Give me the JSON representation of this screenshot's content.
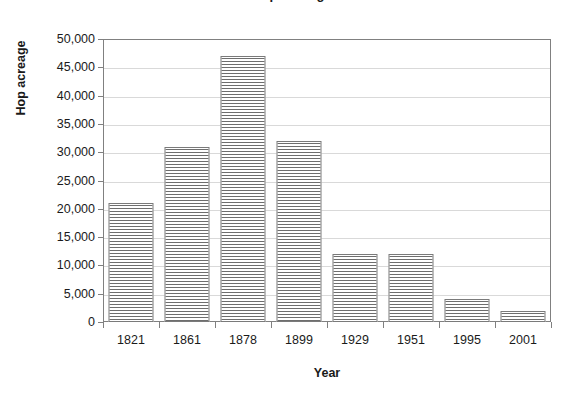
{
  "chart_data": {
    "type": "bar",
    "title": "Hop acreage",
    "title_visible_fragment": "",
    "xlabel": "Year",
    "ylabel": "Hop acreage",
    "categories": [
      "1821",
      "1861",
      "1878",
      "1899",
      "1929",
      "1951",
      "1995",
      "2001"
    ],
    "values": [
      21000,
      31000,
      47000,
      32000,
      12000,
      12000,
      4000,
      2000
    ],
    "ylim": [
      0,
      50000
    ],
    "ytick_step": 5000,
    "ytick_labels": [
      "50,000",
      "45,000",
      "40,000",
      "35,000",
      "30,000",
      "25,000",
      "20,000",
      "15,000",
      "10,000",
      "5,000",
      "0"
    ],
    "ytick_values": [
      50000,
      45000,
      40000,
      35000,
      30000,
      25000,
      20000,
      15000,
      10000,
      5000,
      0
    ],
    "grid": true,
    "grid_axis": "y",
    "legend": false,
    "legend_position": "none",
    "series": [
      {
        "name": "Hop acreage",
        "values": [
          21000,
          31000,
          47000,
          32000,
          12000,
          12000,
          4000,
          2000
        ],
        "fill": "horizontal-line-hatch",
        "border_color": "#7a7a7a",
        "hatch_color": "#6e6e6e"
      }
    ],
    "colors": {
      "background": "#ffffff",
      "axis": "#808080",
      "grid": "#d9d9d9",
      "text": "#1a1a1a",
      "bar_border": "#7a7a7a",
      "bar_hatch": "#6e6e6e"
    }
  }
}
